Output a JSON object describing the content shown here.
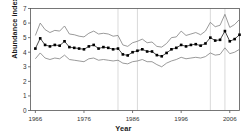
{
  "chart_data": {
    "type": "line",
    "title": "",
    "xlabel": "Year",
    "ylabel": "Abundance index",
    "xlim": [
      1965,
      2008
    ],
    "ylim": [
      0,
      7
    ],
    "grid": "vertical-only",
    "legend": "none",
    "xticks": [
      1966,
      1976,
      1986,
      1996,
      2006
    ],
    "xtick_labels": [
      "1966",
      "1976",
      "1986",
      "1996",
      "2006"
    ],
    "yticks": [
      0,
      1,
      2,
      3,
      4,
      5,
      6,
      7
    ],
    "ytick_labels": [
      "0",
      "1",
      "2",
      "3",
      "4",
      "5",
      "6",
      "7"
    ],
    "vertical_gridlines": [
      1983,
      1987,
      2002,
      2005
    ],
    "x": [
      1966,
      1967,
      1968,
      1969,
      1970,
      1971,
      1972,
      1973,
      1974,
      1975,
      1976,
      1977,
      1978,
      1979,
      1980,
      1981,
      1982,
      1983,
      1984,
      1985,
      1986,
      1987,
      1988,
      1989,
      1990,
      1991,
      1992,
      1993,
      1994,
      1995,
      1996,
      1997,
      1998,
      1999,
      2000,
      2001,
      2002,
      2003,
      2004,
      2005,
      2006,
      2007,
      2008
    ],
    "series": [
      {
        "name": "Upper confidence limit",
        "style": "line",
        "color": "#808080",
        "values": [
          5.15,
          6.0,
          5.55,
          5.35,
          5.5,
          5.45,
          5.8,
          5.25,
          5.2,
          5.1,
          5.05,
          5.3,
          5.45,
          5.25,
          5.3,
          5.25,
          5.1,
          5.15,
          4.5,
          4.4,
          4.65,
          4.75,
          4.9,
          4.65,
          4.7,
          4.4,
          4.35,
          4.6,
          5.0,
          5.05,
          5.45,
          5.15,
          5.25,
          5.35,
          5.2,
          5.45,
          6.05,
          5.75,
          5.85,
          6.6,
          5.7,
          5.9,
          6.25
        ]
      },
      {
        "name": "Abundance index",
        "style": "line-marker",
        "color": "#000000",
        "marker": "square",
        "values": [
          4.25,
          4.95,
          4.5,
          4.4,
          4.5,
          4.45,
          4.75,
          4.35,
          4.3,
          4.25,
          4.2,
          4.4,
          4.5,
          4.25,
          4.35,
          4.3,
          4.2,
          4.25,
          3.85,
          3.78,
          4.0,
          4.1,
          4.2,
          4.05,
          4.05,
          3.8,
          3.72,
          3.95,
          4.2,
          4.3,
          4.5,
          4.4,
          4.5,
          4.55,
          4.45,
          4.6,
          5.0,
          4.8,
          4.85,
          5.45,
          4.75,
          4.9,
          5.2
        ]
      },
      {
        "name": "Lower confidence limit",
        "style": "line",
        "color": "#808080",
        "values": [
          3.55,
          3.95,
          3.6,
          3.5,
          3.6,
          3.55,
          3.8,
          3.5,
          3.45,
          3.4,
          3.35,
          3.55,
          3.6,
          3.45,
          3.5,
          3.45,
          3.4,
          3.45,
          3.25,
          3.2,
          3.35,
          3.4,
          3.5,
          3.35,
          3.35,
          3.15,
          3.0,
          3.25,
          3.4,
          3.5,
          3.65,
          3.55,
          3.6,
          3.65,
          3.6,
          3.7,
          3.95,
          3.8,
          3.85,
          4.3,
          3.9,
          4.0,
          4.2
        ]
      }
    ]
  },
  "axes": {
    "ylabel": "Abundance index",
    "xlabel": "Year"
  }
}
